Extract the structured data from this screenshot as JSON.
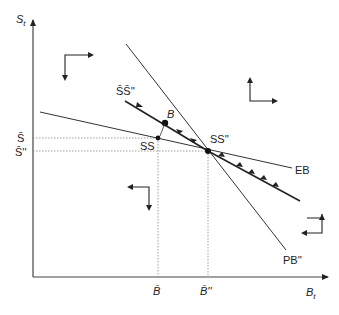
{
  "axes": {
    "y_label": "S",
    "y_sub": "t",
    "x_label": "B",
    "x_sub": "t"
  },
  "y_ticks": [
    {
      "label": "S̄",
      "y": 138
    },
    {
      "label": "S̄''",
      "y": 151
    }
  ],
  "x_ticks": [
    {
      "label": "B̄",
      "x": 158
    },
    {
      "label": "B̄''",
      "x": 208
    }
  ],
  "curves": {
    "pb": {
      "label": "PB''"
    },
    "eb": {
      "label": "EB"
    },
    "saddle": {
      "label": "S̄S̄''"
    }
  },
  "points": {
    "b": {
      "label": "B"
    },
    "ss": {
      "label": "SS"
    },
    "ss_new": {
      "label": "SS''"
    }
  },
  "colors": {
    "ink": "#222222",
    "grid": "#888888"
  }
}
